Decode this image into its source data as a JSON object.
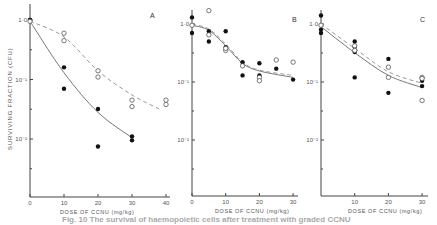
{
  "chart_data": [
    {
      "type": "scatter",
      "panel": "A",
      "title": "A",
      "xlabel": "DOSE OF CCNU (mg/kg)",
      "ylabel": "SURVIVING FRACTION (CFU)",
      "yscale": "log",
      "xlim": [
        0,
        40
      ],
      "ylim": [
        0.001,
        1.0
      ],
      "xticks": [
        0,
        10,
        20,
        30,
        40
      ],
      "yticks": [
        "1·0",
        "10⁻¹",
        "10⁻²"
      ],
      "series": [
        {
          "name": "filled",
          "marker": "filled-circle",
          "points": [
            [
              0,
              1.0
            ],
            [
              0,
              1.0
            ],
            [
              10,
              0.16
            ],
            [
              10,
              0.07
            ],
            [
              20,
              0.032
            ],
            [
              20,
              0.0075
            ],
            [
              30,
              0.011
            ],
            [
              30,
              0.0095
            ]
          ]
        },
        {
          "name": "open",
          "marker": "open-circle",
          "points": [
            [
              0,
              0.95
            ],
            [
              10,
              0.6
            ],
            [
              10,
              0.45
            ],
            [
              20,
              0.14
            ],
            [
              20,
              0.11
            ],
            [
              30,
              0.045
            ],
            [
              30,
              0.035
            ],
            [
              40,
              0.045
            ],
            [
              40,
              0.038
            ]
          ]
        }
      ],
      "curves": [
        {
          "style": "solid",
          "points": [
            [
              0,
              0.95
            ],
            [
              10,
              0.13
            ],
            [
              20,
              0.028
            ],
            [
              30,
              0.0105
            ]
          ]
        },
        {
          "style": "dashed",
          "points": [
            [
              0,
              0.95
            ],
            [
              10,
              0.52
            ],
            [
              20,
              0.14
            ],
            [
              30,
              0.055
            ],
            [
              38,
              0.032
            ]
          ]
        }
      ]
    },
    {
      "type": "scatter",
      "panel": "B",
      "title": "B",
      "xlabel": "DOSE OF CCNU (mg/kg)",
      "ylabel": "",
      "yscale": "log",
      "xlim": [
        0,
        30
      ],
      "ylim": [
        0.001,
        1.0
      ],
      "xticks": [
        0,
        10,
        20,
        30
      ],
      "yticks": [
        "1·0",
        "10⁻¹",
        "10⁻²"
      ],
      "series": [
        {
          "name": "filled",
          "marker": "filled-circle",
          "points": [
            [
              0,
              1.3
            ],
            [
              0,
              0.7
            ],
            [
              5,
              0.75
            ],
            [
              5,
              0.5
            ],
            [
              10,
              0.75
            ],
            [
              10,
              0.4
            ],
            [
              15,
              0.22
            ],
            [
              15,
              0.13
            ],
            [
              20,
              0.21
            ],
            [
              20,
              0.13
            ],
            [
              25,
              0.17
            ],
            [
              30,
              0.11
            ]
          ]
        },
        {
          "name": "open",
          "marker": "open-circle",
          "points": [
            [
              0,
              0.95
            ],
            [
              5,
              1.7
            ],
            [
              5,
              0.65
            ],
            [
              10,
              0.35
            ],
            [
              10,
              0.38
            ],
            [
              15,
              0.19
            ],
            [
              20,
              0.12
            ],
            [
              20,
              0.105
            ],
            [
              25,
              0.24
            ],
            [
              30,
              0.22
            ]
          ]
        }
      ],
      "curves": [
        {
          "style": "solid",
          "points": [
            [
              0,
              0.95
            ],
            [
              5,
              0.78
            ],
            [
              10,
              0.42
            ],
            [
              15,
              0.21
            ],
            [
              20,
              0.155
            ],
            [
              30,
              0.12
            ]
          ]
        },
        {
          "style": "dashed",
          "points": [
            [
              0,
              1.0
            ],
            [
              5,
              0.82
            ],
            [
              10,
              0.45
            ],
            [
              15,
              0.22
            ],
            [
              20,
              0.16
            ],
            [
              30,
              0.13
            ]
          ]
        }
      ]
    },
    {
      "type": "scatter",
      "panel": "C",
      "title": "C",
      "xlabel": "DOSE OF CCNU (mg/kg)",
      "ylabel": "",
      "yscale": "log",
      "xlim": [
        0,
        30
      ],
      "ylim": [
        0.001,
        1.0
      ],
      "xticks": [
        10,
        20,
        30
      ],
      "yticks": [
        "1·0",
        "10⁻¹",
        "10⁻²"
      ],
      "series": [
        {
          "name": "filled",
          "marker": "filled-circle",
          "points": [
            [
              0,
              1.4
            ],
            [
              0,
              0.8
            ],
            [
              0,
              0.7
            ],
            [
              10,
              0.5
            ],
            [
              10,
              0.4
            ],
            [
              10,
              0.33
            ],
            [
              10,
              0.12
            ],
            [
              20,
              0.25
            ],
            [
              20,
              0.065
            ],
            [
              30,
              0.105
            ],
            [
              30,
              0.085
            ]
          ]
        },
        {
          "name": "open",
          "marker": "open-circle",
          "points": [
            [
              0,
              0.95
            ],
            [
              10,
              0.42
            ],
            [
              10,
              0.35
            ],
            [
              20,
              0.18
            ],
            [
              20,
              0.12
            ],
            [
              30,
              0.12
            ],
            [
              30,
              0.115
            ],
            [
              30,
              0.048
            ]
          ]
        }
      ],
      "curves": [
        {
          "style": "solid",
          "points": [
            [
              0,
              0.9
            ],
            [
              10,
              0.32
            ],
            [
              20,
              0.13
            ],
            [
              30,
              0.08
            ]
          ]
        },
        {
          "style": "dashed",
          "points": [
            [
              0,
              1.0
            ],
            [
              10,
              0.38
            ],
            [
              20,
              0.15
            ],
            [
              30,
              0.095
            ]
          ]
        }
      ]
    }
  ],
  "labels": {
    "panel_a": "A",
    "panel_b": "B",
    "panel_c": "C",
    "ylabel": "SURVIVING  FRACTION  (CFU)",
    "xlabel": "DOSE  OF  CCNU  (mg/kg)",
    "ytick_1": "1·0",
    "ytick_2": "10⁻¹",
    "ytick_3": "10⁻²",
    "caption": "Fig. 10  The survival of haemopoietic cells after treatment with graded CCNU"
  }
}
